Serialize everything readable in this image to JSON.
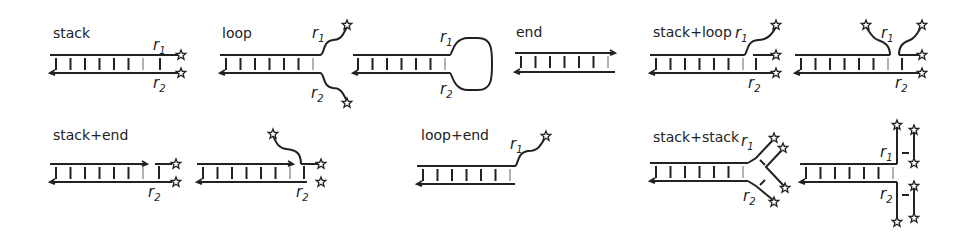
{
  "diagram": {
    "panels": [
      {
        "id": "stack",
        "label": "stack",
        "labels": [
          "r1",
          "r2"
        ]
      },
      {
        "id": "loop-open",
        "label": "loop",
        "labels": [
          "r1",
          "r2"
        ]
      },
      {
        "id": "loop-closed",
        "label": "",
        "labels": [
          "r1",
          "r2"
        ]
      },
      {
        "id": "end",
        "label": "end",
        "labels": []
      },
      {
        "id": "stack-loop-a",
        "label": "stack+loop",
        "labels": [
          "r1",
          "r2"
        ]
      },
      {
        "id": "stack-loop-b",
        "label": "",
        "labels": [
          "r1",
          "r2"
        ]
      },
      {
        "id": "stack-end-a",
        "label": "stack+end",
        "labels": [
          "r2"
        ]
      },
      {
        "id": "stack-end-b",
        "label": "",
        "labels": [
          "r2"
        ]
      },
      {
        "id": "loop-end",
        "label": "loop+end",
        "labels": [
          "r1"
        ]
      },
      {
        "id": "stack-stack-a",
        "label": "stack+stack",
        "labels": [
          "r1",
          "r2"
        ]
      },
      {
        "id": "stack-stack-b",
        "label": "",
        "labels": [
          "r1",
          "r2"
        ]
      }
    ],
    "r1_main": "r",
    "r1_sub": "1",
    "r2_main": "r",
    "r2_sub": "2",
    "colors": {
      "stroke": "#222222",
      "grey_tick": "#999999",
      "background": "#ffffff"
    }
  }
}
